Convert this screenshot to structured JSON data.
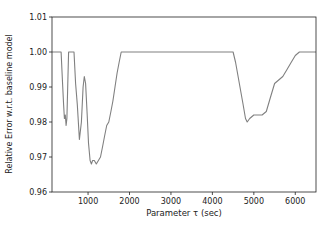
{
  "chart_data": {
    "type": "line",
    "title": "",
    "xlabel": "Parameter τ (sec)",
    "ylabel": "Relative Error w.r.t. baseline model",
    "xlim": [
      130,
      6500
    ],
    "ylim": [
      0.96,
      1.01
    ],
    "grid": false,
    "legend": null,
    "xticks": [
      1000,
      2000,
      3000,
      4000,
      5000,
      6000
    ],
    "xtick_labels": [
      "1000",
      "2000",
      "3000",
      "4000",
      "5000",
      "6000"
    ],
    "yticks": [
      0.96,
      0.97,
      0.98,
      0.99,
      1.0,
      1.01
    ],
    "ytick_labels": [
      "0.96",
      "0.97",
      "0.98",
      "0.99",
      "1.00",
      "1.01"
    ],
    "series": [
      {
        "name": "relative error",
        "color": "#808080",
        "x": [
          130,
          350,
          380,
          410,
          430,
          450,
          470,
          490,
          510,
          530,
          660,
          700,
          740,
          790,
          840,
          880,
          910,
          940,
          980,
          1010,
          1050,
          1080,
          1110,
          1150,
          1200,
          1250,
          1300,
          1350,
          1400,
          1450,
          1500,
          1550,
          1600,
          1650,
          1700,
          1750,
          1800,
          2500,
          3500,
          4500,
          4560,
          4620,
          4680,
          4740,
          4800,
          4840,
          4900,
          5000,
          5100,
          5200,
          5300,
          5400,
          5500,
          5600,
          5700,
          5800,
          5900,
          6000,
          6100,
          6500
        ],
        "y": [
          1.0,
          1.0,
          0.992,
          0.985,
          0.981,
          0.982,
          0.979,
          0.981,
          0.99,
          1.0,
          1.0,
          0.991,
          0.985,
          0.975,
          0.98,
          0.99,
          0.993,
          0.991,
          0.982,
          0.974,
          0.969,
          0.968,
          0.969,
          0.969,
          0.968,
          0.969,
          0.97,
          0.973,
          0.976,
          0.979,
          0.98,
          0.983,
          0.986,
          0.99,
          0.994,
          0.997,
          1.0,
          1.0,
          1.0,
          1.0,
          0.997,
          0.993,
          0.989,
          0.985,
          0.981,
          0.98,
          0.981,
          0.982,
          0.982,
          0.982,
          0.983,
          0.987,
          0.991,
          0.992,
          0.993,
          0.995,
          0.997,
          0.999,
          1.0,
          1.0
        ]
      }
    ]
  }
}
